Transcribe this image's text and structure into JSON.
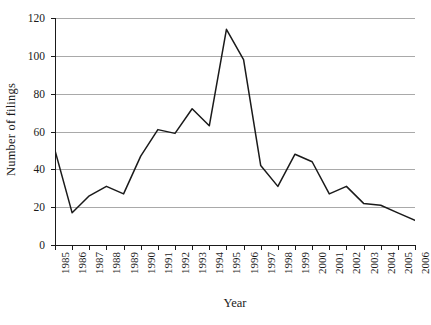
{
  "chart_data": {
    "type": "line",
    "title": "",
    "xlabel": "Year",
    "ylabel": "Number of filings",
    "categories": [
      "1985",
      "1986",
      "1987",
      "1988",
      "1989",
      "1990",
      "1991",
      "1992",
      "1993",
      "1994",
      "1995",
      "1996",
      "1997",
      "1998",
      "1999",
      "2000",
      "2001",
      "2002",
      "2003",
      "2004",
      "2005",
      "2006"
    ],
    "values": [
      50,
      17,
      26,
      31,
      27,
      47,
      61,
      59,
      72,
      63,
      114,
      98,
      42,
      31,
      48,
      44,
      27,
      31,
      22,
      21,
      17,
      13
    ],
    "series": [
      {
        "name": "Number of filings",
        "values": [
          50,
          17,
          26,
          31,
          27,
          47,
          61,
          59,
          72,
          63,
          114,
          98,
          42,
          31,
          48,
          44,
          27,
          31,
          22,
          21,
          17,
          13
        ]
      }
    ],
    "ylim": [
      0,
      120
    ],
    "yticks": [
      0,
      20,
      40,
      60,
      80,
      100,
      120
    ],
    "ytick_labels": [
      "0",
      "20",
      "40",
      "60",
      "80",
      "100",
      "120"
    ],
    "xlim": [
      "1985",
      "2006"
    ],
    "grid": "horizontal",
    "legend": "none",
    "line_color": "#1a1a1a",
    "grid_color": "#a9a9a9",
    "axis_color": "#1a1a1a",
    "background_color": "#ffffff"
  }
}
